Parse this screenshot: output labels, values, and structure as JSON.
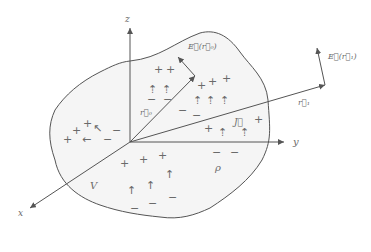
{
  "diagram": {
    "axes": {
      "x": "x",
      "y": "y",
      "z": "z"
    },
    "labels": {
      "volume": "V",
      "charge_density": "ρ",
      "current_density": "J⃗",
      "r0": "r⃗₀",
      "r1": "r⃗₁",
      "E_r0": "E⃗(r⃗₀)",
      "E_r1": "E⃗(r⃗₁)"
    },
    "colors": {
      "line": "#555555",
      "fill": "#f5f5f5",
      "text": "#6a6a6a"
    }
  }
}
